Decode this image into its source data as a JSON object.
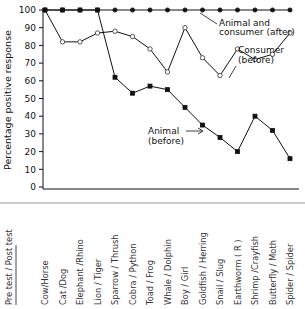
{
  "chart_data": {
    "type": "line",
    "title": "",
    "xlabel": "Pre test / Post test",
    "ylabel": "Percentage positive response",
    "ylim": [
      0,
      100
    ],
    "yticks": [
      0,
      10,
      20,
      30,
      40,
      50,
      60,
      70,
      80,
      90,
      100
    ],
    "grid": false,
    "legend_position": "inline-annotations",
    "categories": [
      "Cow/Horse",
      "Cat /Dog",
      "Elephant /Rhino",
      "Lion / Tiger",
      "Sparrow / Thrush",
      "Cobra  / Python",
      "Toad / Frog",
      "Whale / Dolphin",
      "Boy / Girl",
      "Goldfish / Herring",
      "Snail / Slug",
      "Earthworm  ( R )",
      "Shrimp /Crayfish",
      "Butterfly / Moth",
      "Spider / Spider"
    ],
    "series": [
      {
        "name": "Animal and consumer (after)",
        "marker": "filled-circle",
        "values": [
          100,
          100,
          100,
          100,
          100,
          100,
          100,
          100,
          100,
          100,
          100,
          100,
          100,
          100,
          100
        ]
      },
      {
        "name": "Consumer (before)",
        "marker": "open-circle",
        "values": [
          100,
          82,
          82,
          87,
          88,
          85,
          78,
          65,
          90,
          73,
          63,
          78,
          72,
          75,
          87
        ]
      },
      {
        "name": "Animal (before)",
        "marker": "filled-square",
        "values": [
          100,
          100,
          100,
          100,
          62,
          53,
          57,
          55,
          45,
          35,
          28,
          20,
          40,
          32,
          16
        ]
      }
    ],
    "annotations": [
      {
        "id": "annot-after",
        "line1": "Animal  and",
        "line2": "consumer (after)"
      },
      {
        "id": "annot-consumer",
        "line1": "Consumer",
        "line2": "(before)"
      },
      {
        "id": "annot-animal",
        "line1": "Animal",
        "line2": "(before)"
      }
    ]
  }
}
